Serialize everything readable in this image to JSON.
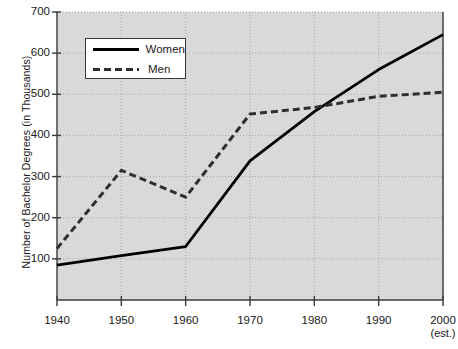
{
  "chart_data": {
    "type": "line",
    "title": "",
    "xlabel": "",
    "ylabel": "Number of Bachelor Degrees (in Thousands)",
    "x": [
      1940,
      1950,
      1960,
      1970,
      1980,
      1990,
      2000
    ],
    "xtick_labels": [
      "1940",
      "1950",
      "1960",
      "1970",
      "1980",
      "1990",
      "2000"
    ],
    "xtick_sublabels": [
      "",
      "",
      "",
      "",
      "",
      "",
      "(est.)"
    ],
    "ytick_labels": [
      "100",
      "200",
      "300",
      "400",
      "500",
      "600",
      "700"
    ],
    "yticks": [
      100,
      200,
      300,
      400,
      500,
      600,
      700
    ],
    "ylim": [
      0,
      700
    ],
    "xlim": [
      1940,
      2000
    ],
    "grid": true,
    "legend_position": "upper-left-inside",
    "series": [
      {
        "name": "Women",
        "style": "solid",
        "color": "#000000",
        "values": [
          85,
          108,
          130,
          338,
          458,
          560,
          645
        ]
      },
      {
        "name": "Men",
        "style": "dashed",
        "color": "#2e2e2e",
        "values": [
          125,
          315,
          250,
          452,
          468,
          495,
          505
        ]
      }
    ],
    "plot_background": "#d9d9d9",
    "axis_color": "#3a3a3a",
    "gridline_color": "#9a9a9a"
  },
  "legend": {
    "items": [
      {
        "label": "Women"
      },
      {
        "label": "Men"
      }
    ]
  }
}
